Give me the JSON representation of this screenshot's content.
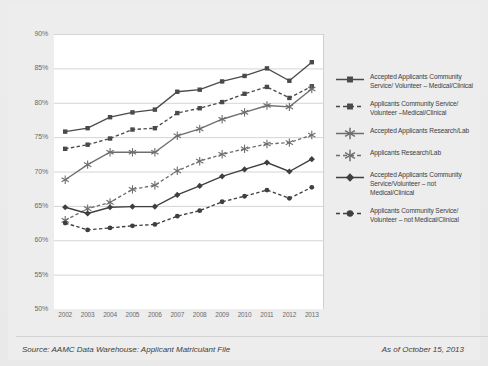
{
  "footer": {
    "source": "Source: AAMC Data Warehouse: Applicant Matriculant File",
    "as_of": "As of October 15, 2013"
  },
  "legend": {
    "items": [
      {
        "label": "Accepted Applicants Community Service/ Volunteer – Medical/Clinical",
        "marker": "square",
        "dash": false,
        "color": "#4a4a4a"
      },
      {
        "label": "Applicants Community Service/ Volunteer –Medical/Clinical",
        "marker": "square",
        "dash": true,
        "color": "#4a4a4a"
      },
      {
        "label": "Accepted Applicants Research/Lab",
        "marker": "asterisk",
        "dash": false,
        "color": "#6e6e6e"
      },
      {
        "label": "Applicants Research/Lab",
        "marker": "asterisk",
        "dash": true,
        "color": "#6e6e6e"
      },
      {
        "label": "Accepted Applicants Community Service/Volunteer – not Medical/Clinical",
        "marker": "diamond",
        "dash": false,
        "color": "#3f3f3f"
      },
      {
        "label": "Applicants Community Service/ Volunteer – not Medical/Clinical",
        "marker": "circle",
        "dash": true,
        "color": "#3f3f3f"
      }
    ]
  },
  "chart_data": {
    "type": "line",
    "title": "",
    "xlabel": "",
    "ylabel": "",
    "ylim": [
      50,
      90
    ],
    "ytick_step": 5,
    "ytick_labels": [
      "90%",
      "85%",
      "80%",
      "75%",
      "70%",
      "65%",
      "60%",
      "55%",
      "50%"
    ],
    "grid": true,
    "legend_position": "right",
    "categories": [
      "2002",
      "2003",
      "2004",
      "2005",
      "2006",
      "2007",
      "2008",
      "2009",
      "2010",
      "2011",
      "2012",
      "2013"
    ],
    "series": [
      {
        "name": "Accepted Applicants Community Service/ Volunteer – Medical/Clinical",
        "marker": "square",
        "dash": false,
        "color": "#4a4a4a",
        "values": [
          75.8,
          76.3,
          77.9,
          78.6,
          79.0,
          81.6,
          81.9,
          83.1,
          83.9,
          85.0,
          83.2,
          85.9
        ]
      },
      {
        "name": "Applicants Community Service/ Volunteer –Medical/Clinical",
        "marker": "square",
        "dash": true,
        "color": "#4a4a4a",
        "values": [
          73.3,
          73.9,
          74.8,
          76.1,
          76.3,
          78.5,
          79.2,
          80.1,
          81.3,
          82.3,
          80.7,
          82.4
        ]
      },
      {
        "name": "Accepted Applicants Research/Lab",
        "marker": "asterisk",
        "dash": false,
        "color": "#6e6e6e",
        "values": [
          68.8,
          71.0,
          72.8,
          72.8,
          72.8,
          75.2,
          76.2,
          77.6,
          78.6,
          79.6,
          79.4,
          82.0
        ]
      },
      {
        "name": "Applicants Research/Lab",
        "marker": "asterisk",
        "dash": true,
        "color": "#6e6e6e",
        "values": [
          62.9,
          64.6,
          65.5,
          67.4,
          68.0,
          70.1,
          71.5,
          72.5,
          73.3,
          74.0,
          74.2,
          75.3
        ]
      },
      {
        "name": "Accepted Applicants Community Service/Volunteer – not Medical/Clinical",
        "marker": "diamond",
        "dash": false,
        "color": "#3f3f3f",
        "values": [
          64.8,
          63.9,
          64.8,
          64.9,
          64.9,
          66.6,
          67.9,
          69.3,
          70.3,
          71.3,
          70.0,
          71.8
        ]
      },
      {
        "name": "Applicants Community Service/ Volunteer – not Medical/Clinical",
        "marker": "circle",
        "dash": true,
        "color": "#3f3f3f",
        "values": [
          62.5,
          61.5,
          61.8,
          62.1,
          62.3,
          63.5,
          64.3,
          65.6,
          66.4,
          67.3,
          66.1,
          67.7
        ]
      }
    ]
  }
}
